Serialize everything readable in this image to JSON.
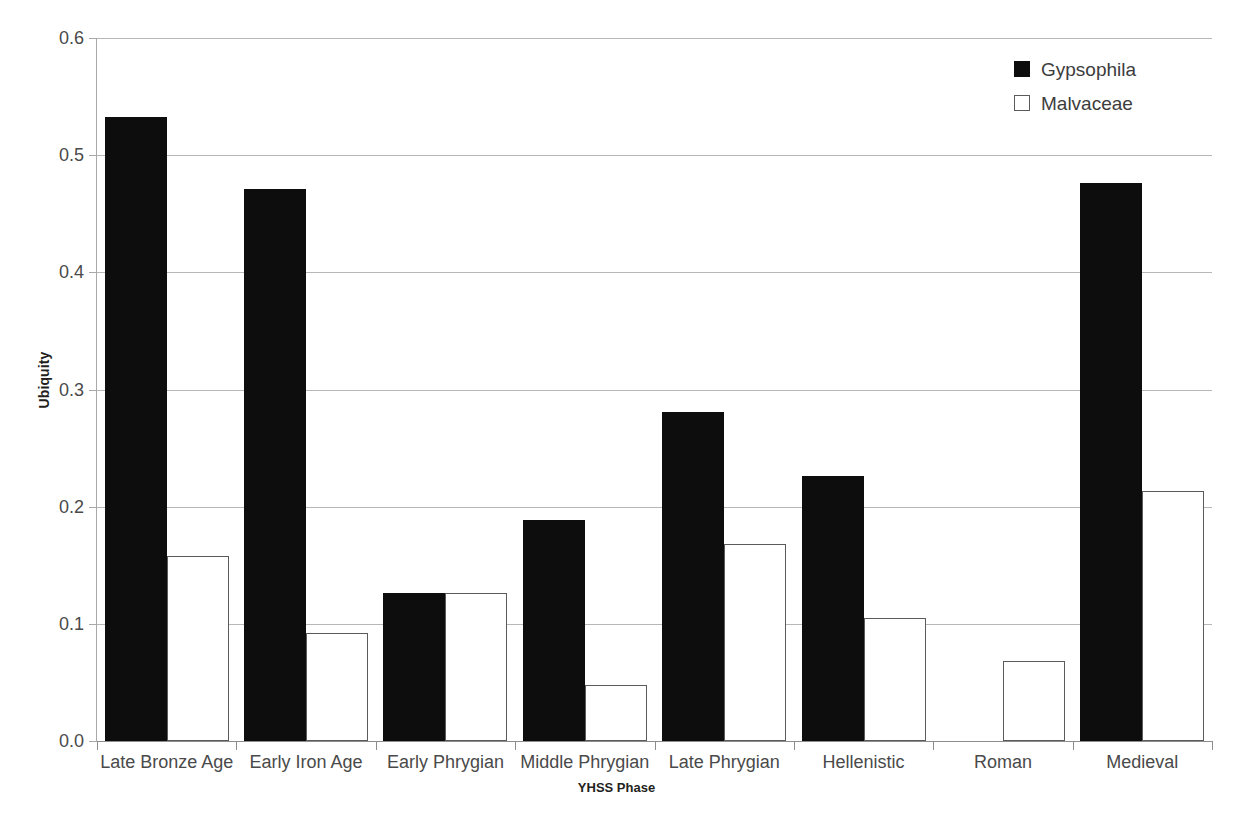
{
  "chart_data": {
    "type": "bar",
    "title": "",
    "subtitle": "",
    "xlabel": "YHSS Phase",
    "ylabel": "Ubiquity",
    "ylim": [
      0.0,
      0.6
    ],
    "ytick_labels": [
      "0.6",
      "0.5",
      "0.4",
      "0.3",
      "0.2",
      "0.1",
      "0.0"
    ],
    "ytick_values": [
      0.6,
      0.5,
      0.4,
      0.3,
      0.2,
      0.1,
      0.0
    ],
    "grid": "horizontal",
    "legend_position": "top-right",
    "categories": [
      "Late Bronze Age",
      "Early Iron Age",
      "Early Phrygian",
      "Middle Phrygian",
      "Late Phrygian",
      "Hellenistic",
      "Roman",
      "Medieval"
    ],
    "series": [
      {
        "name": "Gypsophila",
        "color": "#0d0d0d",
        "fill": "solid",
        "values": [
          0.533,
          0.471,
          0.126,
          0.189,
          0.281,
          0.226,
          0.0,
          0.476
        ]
      },
      {
        "name": "Malvaceae",
        "color": "#ffffff",
        "fill": "hollow",
        "values": [
          0.158,
          0.092,
          0.126,
          0.048,
          0.168,
          0.105,
          0.068,
          0.213
        ]
      }
    ]
  },
  "legend": {
    "entries": [
      {
        "label": "Gypsophila"
      },
      {
        "label": "Malvaceae"
      }
    ]
  },
  "axes": {
    "y_title": "Ubiquity",
    "x_title": "YHSS Phase"
  },
  "colors": {
    "series_gypsophila": "#0d0d0d",
    "series_malvaceae": "#ffffff",
    "gridline": "#b7b7b7",
    "axis": "#8d8d8d",
    "tick_text": "#4a4a4a",
    "title_text": "#231f20",
    "background": "#ffffff"
  }
}
